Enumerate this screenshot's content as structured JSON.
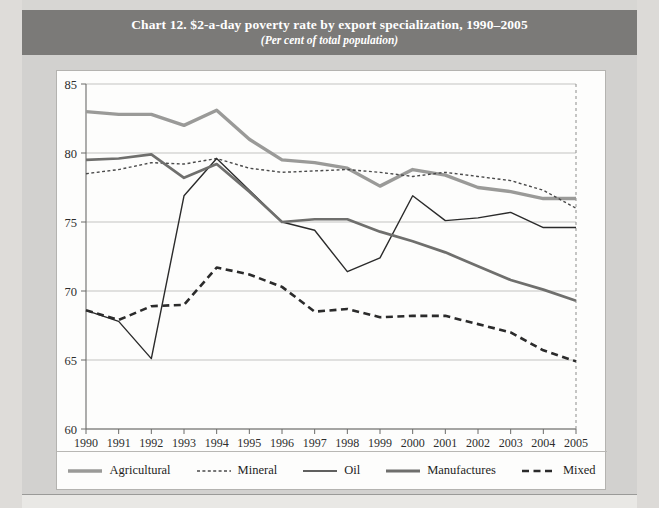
{
  "banner": {
    "title": "Chart 12. $2-a-day poverty rate by export specialization, 1990–2005",
    "subtitle": "(Per cent of total population)",
    "background_color": "#7b7a78",
    "text_color": "#ffffff"
  },
  "chart_data": {
    "type": "line",
    "title": "Chart 12. $2-a-day poverty rate by export specialization, 1990–2005",
    "subtitle": "(Per cent of total population)",
    "xlabel": "",
    "ylabel": "",
    "ylim": [
      60,
      85
    ],
    "yticks": [
      60,
      65,
      70,
      75,
      80,
      85
    ],
    "ytick_labels": [
      "60",
      "65",
      "70",
      "75",
      "80",
      "85"
    ],
    "grid": true,
    "grid_axis": "y",
    "legend_position": "bottom",
    "categories": [
      "1990",
      "1991",
      "1992",
      "1993",
      "1994",
      "1995",
      "1996",
      "1997",
      "1998",
      "1999",
      "2000",
      "2001",
      "2002",
      "2003",
      "2004",
      "2005"
    ],
    "series": [
      {
        "name": "Agricultural",
        "color": "#9a9a98",
        "style": "solid",
        "width": 3.4,
        "values": [
          83.0,
          82.8,
          82.8,
          82.0,
          83.1,
          81.0,
          79.5,
          79.3,
          78.9,
          77.6,
          78.8,
          78.4,
          77.5,
          77.2,
          76.7,
          76.7
        ]
      },
      {
        "name": "Mineral",
        "color": "#4a4a4a",
        "style": "dotted",
        "width": 1.4,
        "values": [
          78.5,
          78.8,
          79.3,
          79.2,
          79.6,
          78.9,
          78.6,
          78.7,
          78.8,
          78.6,
          78.3,
          78.6,
          78.3,
          78.0,
          77.3,
          76.0
        ]
      },
      {
        "name": "Oil",
        "color": "#2b2b2b",
        "style": "solid",
        "width": 1.4,
        "values": [
          68.6,
          67.8,
          65.1,
          76.9,
          79.6,
          77.3,
          75.0,
          74.4,
          71.4,
          72.4,
          76.9,
          75.1,
          75.3,
          75.7,
          74.6,
          74.6
        ]
      },
      {
        "name": "Manufactures",
        "color": "#6f6f6d",
        "style": "solid",
        "width": 2.7,
        "values": [
          79.5,
          79.6,
          79.9,
          78.2,
          79.2,
          77.2,
          75.0,
          75.2,
          75.2,
          74.3,
          73.6,
          72.8,
          71.8,
          70.8,
          70.1,
          69.3
        ]
      },
      {
        "name": "Mixed",
        "color": "#2b2b2b",
        "style": "dashed",
        "width": 2.6,
        "values": [
          68.6,
          67.9,
          68.9,
          69.0,
          71.7,
          71.2,
          70.3,
          68.5,
          68.7,
          68.1,
          68.2,
          68.2,
          67.6,
          67.0,
          65.7,
          64.9
        ]
      }
    ]
  },
  "legend": [
    {
      "label": "Agricultural"
    },
    {
      "label": "Mineral"
    },
    {
      "label": "Oil"
    },
    {
      "label": "Manufactures"
    },
    {
      "label": "Mixed"
    }
  ]
}
